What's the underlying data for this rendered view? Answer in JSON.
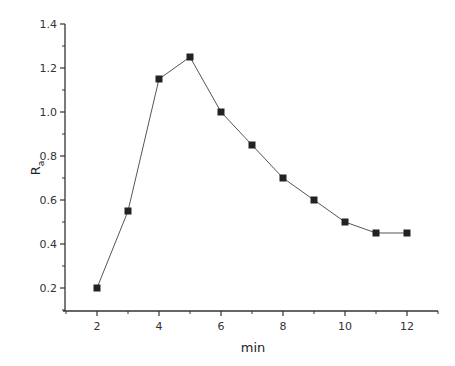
{
  "chart_data": {
    "type": "line",
    "title": "",
    "xlabel": "min",
    "ylabel": "R",
    "ylabel_subscript": "a",
    "x": [
      2,
      3,
      4,
      5,
      6,
      7,
      8,
      9,
      10,
      11,
      12
    ],
    "series": [
      {
        "name": "Ra",
        "values": [
          0.2,
          0.55,
          1.15,
          1.25,
          1.0,
          0.85,
          0.7,
          0.6,
          0.5,
          0.45,
          0.45
        ],
        "marker": "square",
        "color": "#222222"
      }
    ],
    "xlim": [
      1,
      13
    ],
    "ylim": [
      0.1,
      1.4
    ],
    "xticks": [
      2,
      4,
      6,
      8,
      10,
      12
    ],
    "xtick_labels": [
      "2",
      "4",
      "6",
      "8",
      "10",
      "12"
    ],
    "yticks": [
      0.2,
      0.4,
      0.6,
      0.8,
      1.0,
      1.2,
      1.4
    ],
    "ytick_labels": [
      "0.2",
      "0.4",
      "0.6",
      "0.8",
      "1.0",
      "1.2",
      "1.4"
    ],
    "grid": false,
    "legend": null
  }
}
